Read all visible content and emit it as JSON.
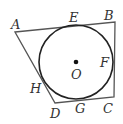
{
  "diagram": {
    "title": "",
    "shape": "quadrilateral circumscribed about a circle",
    "colors": {
      "stroke": "#333333",
      "background": "#ffffff"
    },
    "vertices": [
      {
        "id": "A",
        "label": "A",
        "x": 15,
        "y": 32,
        "lx": 11,
        "ly": 29
      },
      {
        "id": "B",
        "label": "B",
        "x": 115,
        "y": 22,
        "lx": 104,
        "ly": 20
      },
      {
        "id": "C",
        "label": "C",
        "x": 114,
        "y": 97,
        "lx": 103,
        "ly": 113
      },
      {
        "id": "D",
        "label": "D",
        "x": 55,
        "y": 103,
        "lx": 50,
        "ly": 118
      }
    ],
    "circle": {
      "center_label": "O",
      "cx": 76,
      "cy": 62,
      "r": 37,
      "lx": 71,
      "ly": 79
    },
    "tangent_points": [
      {
        "id": "E",
        "label": "E",
        "lx": 69,
        "ly": 22
      },
      {
        "id": "F",
        "label": "F",
        "lx": 100,
        "ly": 67
      },
      {
        "id": "G",
        "label": "G",
        "lx": 75,
        "ly": 113
      },
      {
        "id": "H",
        "label": "H",
        "lx": 30,
        "ly": 93
      }
    ]
  }
}
